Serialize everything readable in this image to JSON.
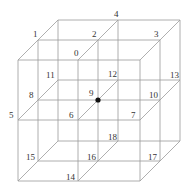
{
  "diagram": {
    "type": "3x3x3 lattice (oblique projection)",
    "colors": {
      "line": "#9a9a9a",
      "label": "#333333",
      "center_dot": "#111111"
    },
    "center_node": "9",
    "nodes": [
      {
        "id": "0",
        "x": 78,
        "y": 60,
        "lx": 74,
        "ly": 56
      },
      {
        "id": "1",
        "x": 38,
        "y": 40,
        "lx": 33,
        "ly": 37
      },
      {
        "id": "2",
        "x": 98,
        "y": 40,
        "lx": 92,
        "ly": 37
      },
      {
        "id": "3",
        "x": 160,
        "y": 40,
        "lx": 154,
        "ly": 37
      },
      {
        "id": "4",
        "x": 118,
        "y": 20,
        "lx": 114,
        "ly": 17
      },
      {
        "id": "5",
        "x": 18,
        "y": 120,
        "lx": 9,
        "ly": 118
      },
      {
        "id": "6",
        "x": 78,
        "y": 120,
        "lx": 69,
        "ly": 118
      },
      {
        "id": "7",
        "x": 140,
        "y": 120,
        "lx": 131,
        "ly": 118
      },
      {
        "id": "8",
        "x": 38,
        "y": 100,
        "lx": 29,
        "ly": 98
      },
      {
        "id": "9",
        "x": 98,
        "y": 100,
        "lx": 89,
        "ly": 96
      },
      {
        "id": "10",
        "x": 160,
        "y": 100,
        "lx": 149,
        "ly": 98
      },
      {
        "id": "11",
        "x": 58,
        "y": 80,
        "lx": 46,
        "ly": 78
      },
      {
        "id": "12",
        "x": 118,
        "y": 80,
        "lx": 108,
        "ly": 77
      },
      {
        "id": "13",
        "x": 180,
        "y": 80,
        "lx": 170,
        "ly": 78
      },
      {
        "id": "14",
        "x": 78,
        "y": 181,
        "lx": 66,
        "ly": 180
      },
      {
        "id": "15",
        "x": 38,
        "y": 161,
        "lx": 26,
        "ly": 160
      },
      {
        "id": "16",
        "x": 98,
        "y": 161,
        "lx": 87,
        "ly": 160
      },
      {
        "id": "17",
        "x": 160,
        "y": 161,
        "lx": 148,
        "ly": 160
      },
      {
        "id": "18",
        "x": 118,
        "y": 141,
        "lx": 108,
        "ly": 140
      }
    ],
    "grid": {
      "front_x": [
        18,
        78,
        140
      ],
      "levels_y": [
        60,
        120,
        181
      ],
      "depth_offsets": [
        [
          0,
          0
        ],
        [
          20,
          -20
        ],
        [
          40,
          -40
        ]
      ]
    }
  }
}
